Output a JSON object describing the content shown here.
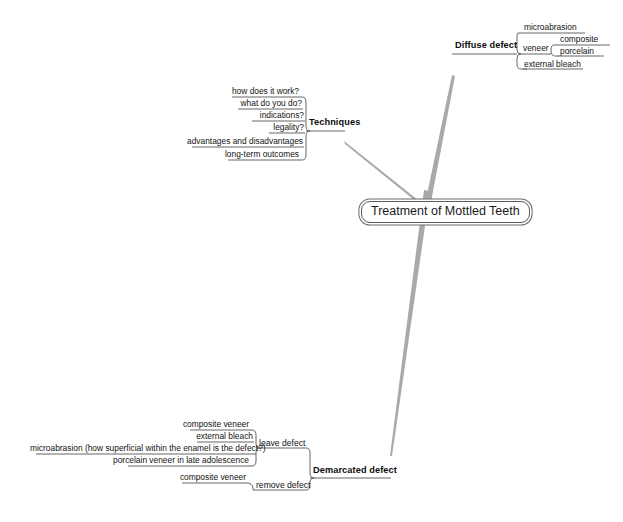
{
  "meta": {
    "diagram_type": "mind-map",
    "background": "#ffffff",
    "line_color": "#a9a9a9",
    "stroke_color": "#555555",
    "text_color": "#111111"
  },
  "root": {
    "label": "Treatment of Mottled Teeth"
  },
  "branches": {
    "diffuse": {
      "label": "Diffuse defect",
      "children": [
        {
          "label": "microabrasion"
        },
        {
          "label": "veneer",
          "children": [
            {
              "label": "composite"
            },
            {
              "label": "porcelain"
            }
          ]
        },
        {
          "label": "external bleach"
        }
      ]
    },
    "techniques": {
      "label": "Techniques",
      "children": [
        {
          "label": "how does it work?"
        },
        {
          "label": "what do you do?"
        },
        {
          "label": "indications?"
        },
        {
          "label": "legality?"
        },
        {
          "label": "advantages and disadvantages"
        },
        {
          "label": "long-term outcomes"
        }
      ]
    },
    "demarcated": {
      "label": "Demarcated defect",
      "children": [
        {
          "label": "leave defect",
          "children": [
            {
              "label": "composite veneer"
            },
            {
              "label": "external bleach"
            },
            {
              "label": "microabrasion (how superficial within the enamel is the defect?)"
            },
            {
              "label": "porcelain veneer in late adolescence"
            }
          ]
        },
        {
          "label": "remove defect",
          "children": [
            {
              "label": "composite veneer"
            }
          ]
        }
      ]
    }
  }
}
